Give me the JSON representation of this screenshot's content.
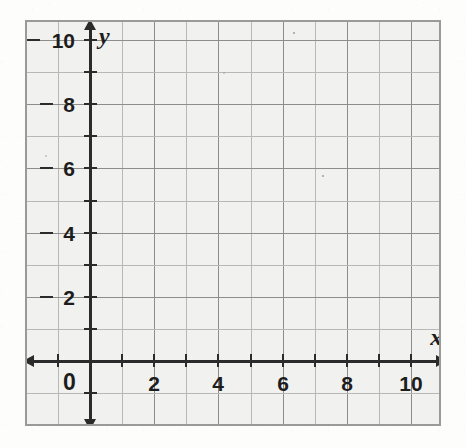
{
  "figure": {
    "kind": "blank-coordinate-grid",
    "axis_labels": {
      "x": "x",
      "y": "y"
    },
    "origin_label": "0"
  },
  "chart_data": {
    "type": "scatter",
    "title": "",
    "subtitle": "",
    "xlabel": "x",
    "ylabel": "y",
    "xlim": [
      -1,
      11.5
    ],
    "ylim": [
      -1.5,
      11
    ],
    "xticks": [
      0,
      1,
      2,
      3,
      4,
      5,
      6,
      7,
      8,
      9,
      10
    ],
    "yticks": [
      0,
      1,
      2,
      3,
      4,
      5,
      6,
      7,
      8,
      9,
      10
    ],
    "xtick_labels": [
      "0",
      "",
      "2",
      "",
      "4",
      "",
      "6",
      "",
      "8",
      "",
      "10"
    ],
    "ytick_labels": [
      "",
      "",
      "2",
      "",
      "4",
      "",
      "6",
      "",
      "8",
      "",
      "10"
    ],
    "x_labeled_values": [
      0,
      2,
      4,
      6,
      8,
      10
    ],
    "y_labeled_values": [
      2,
      4,
      6,
      8,
      10
    ],
    "grid": true,
    "grid_step": 1,
    "grid_major_step": 2,
    "legend": null,
    "series": [],
    "annotations": [],
    "note": "Empty first-quadrant coordinate plane for plotting; no data plotted."
  },
  "colors": {
    "page_background": "#fdfdfc",
    "plot_background": "#f1f1ef",
    "frame_border": "#9a9a9a",
    "gridline_minor": "#b8b8b6",
    "gridline_major": "#8d8d8b",
    "axis": "#2b2b2b",
    "label_text": "#1d1d1d"
  },
  "geometry": {
    "frame": {
      "left": 25,
      "top": 20,
      "width": 416,
      "height": 406
    },
    "origin": {
      "x": 88,
      "y": 359
    },
    "unit_px": 32.1
  }
}
